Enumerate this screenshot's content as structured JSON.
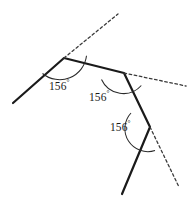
{
  "figure": {
    "title": "",
    "background_color": "#ffffff",
    "stroke_color": "#1a1a1a",
    "dash_color": "#3a3a3a",
    "arc_color": "#2a2a2a",
    "degree_symbol": "°",
    "polyline": {
      "name": "solid-polyline",
      "points": "13,103 64,58 124,73 150,127 122,194",
      "stroke_width": "2.2"
    },
    "dashed_rays": [
      {
        "name": "dashed-ray-1",
        "points": "64,58 118,14"
      },
      {
        "name": "dashed-ray-2",
        "points": "124,73 186,86"
      },
      {
        "name": "dashed-ray-3",
        "points": "150,127 179,187"
      }
    ],
    "arcs": [
      {
        "name": "angle-arc-1",
        "path": "M 42.5,73.5 A 27,27 0 0 0 86.5,55.8"
      },
      {
        "name": "angle-arc-2",
        "path": "M 101.5,79.5 A 24,24 0 0 0 141.3,85.5"
      },
      {
        "name": "angle-arc-3",
        "path": "M 131.0,113.0 A 23,23 0 0 0 155.0,150.5"
      }
    ],
    "angle_labels": [
      {
        "name": "angle-label-1",
        "value": "156",
        "unit": "°"
      },
      {
        "name": "angle-label-2",
        "value": "156",
        "unit": "°"
      },
      {
        "name": "angle-label-3",
        "value": "156",
        "unit": "°"
      }
    ]
  },
  "chart_data": {
    "type": "diagram",
    "subtype": "geometry-exterior-angles",
    "title": "",
    "vertices": [
      {
        "label": "",
        "x": 13,
        "y": 103
      },
      {
        "label": "",
        "x": 64,
        "y": 58
      },
      {
        "label": "",
        "x": 124,
        "y": 73
      },
      {
        "label": "",
        "x": 150,
        "y": 127
      },
      {
        "label": "",
        "x": 122,
        "y": 194
      }
    ],
    "exterior_angles_deg": [
      156,
      156,
      156
    ],
    "annotations": [
      "156°",
      "156°",
      "156°"
    ]
  }
}
